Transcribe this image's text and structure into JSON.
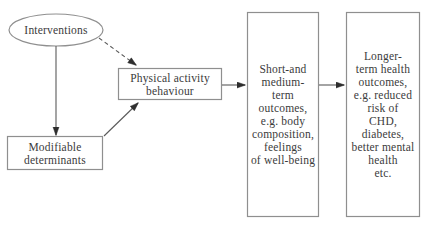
{
  "diagram": {
    "colors": {
      "background": "#ffffff",
      "shape_border": "#8f8f8f",
      "connector_line": "#5a5a5a",
      "arrowhead": "#2e2e2e",
      "text": "#3b3b3b"
    },
    "nodes": {
      "interventions": {
        "shape": "ellipse",
        "label": "Interventions"
      },
      "modifiable_determinants": {
        "shape": "rect",
        "label": "Modifiable\ndeterminants"
      },
      "physical_activity": {
        "shape": "rect",
        "label": "Physical activity\nbehaviour"
      },
      "short_medium_outcomes": {
        "shape": "rect",
        "label": "Short-and\nmedium-\nterm\noutcomes,\ne.g. body\ncomposition,\nfeelings\nof well-being"
      },
      "longer_term_outcomes": {
        "shape": "rect",
        "label": "Longer-\nterm health\noutcomes,\ne.g. reduced\nrisk of\nCHD,\ndiabetes,\nbetter mental\nhealth\netc."
      }
    },
    "edges": [
      {
        "from": "interventions",
        "to": "modifiable_determinants",
        "style": "solid",
        "arrow": true
      },
      {
        "from": "interventions",
        "to": "physical_activity",
        "style": "dashed",
        "arrow": true
      },
      {
        "from": "modifiable_determinants",
        "to": "physical_activity",
        "style": "solid",
        "arrow": true
      },
      {
        "from": "physical_activity",
        "to": "short_medium_outcomes",
        "style": "solid",
        "arrow": true
      },
      {
        "from": "short_medium_outcomes",
        "to": "longer_term_outcomes",
        "style": "solid",
        "arrow": true
      }
    ]
  }
}
